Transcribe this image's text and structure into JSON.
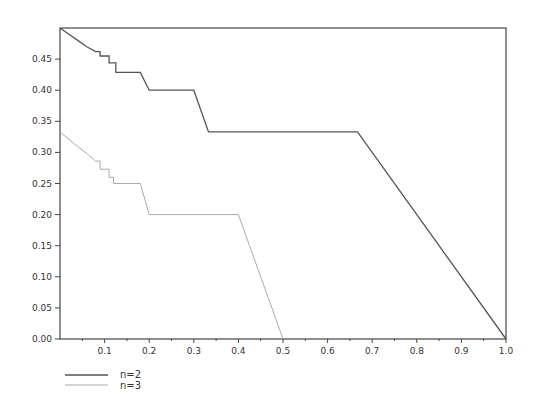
{
  "chart_data": {
    "type": "line",
    "title": "",
    "xlabel": "",
    "ylabel": "",
    "xlim": [
      0,
      1.0
    ],
    "ylim": [
      0,
      0.5
    ],
    "grid": false,
    "legend_position": "below-left",
    "x_ticks": [
      "0.1",
      "0.2",
      "0.3",
      "0.4",
      "0.5",
      "0.6",
      "0.7",
      "0.8",
      "0.9",
      "1.0"
    ],
    "y_ticks": [
      "0.00",
      "0.05",
      "0.10",
      "0.15",
      "0.20",
      "0.25",
      "0.30",
      "0.35",
      "0.40",
      "0.45"
    ],
    "series": [
      {
        "name": "n=2",
        "color": "#555555",
        "points": [
          [
            0.0,
            0.5
          ],
          [
            0.02,
            0.49
          ],
          [
            0.04,
            0.48
          ],
          [
            0.06,
            0.47
          ],
          [
            0.08,
            0.462
          ],
          [
            0.09,
            0.462
          ],
          [
            0.09,
            0.455
          ],
          [
            0.11,
            0.455
          ],
          [
            0.11,
            0.444
          ],
          [
            0.125,
            0.444
          ],
          [
            0.125,
            0.4286
          ],
          [
            0.18,
            0.4286
          ],
          [
            0.2,
            0.4
          ],
          [
            0.3,
            0.4
          ],
          [
            0.333,
            0.333
          ],
          [
            0.667,
            0.333
          ],
          [
            1.0,
            0.0
          ]
        ]
      },
      {
        "name": "n=3",
        "color": "#aaaaaa",
        "points": [
          [
            0.0,
            0.333
          ],
          [
            0.03,
            0.315
          ],
          [
            0.06,
            0.298
          ],
          [
            0.08,
            0.286
          ],
          [
            0.09,
            0.286
          ],
          [
            0.09,
            0.273
          ],
          [
            0.11,
            0.273
          ],
          [
            0.11,
            0.26
          ],
          [
            0.12,
            0.26
          ],
          [
            0.12,
            0.25
          ],
          [
            0.18,
            0.25
          ],
          [
            0.2,
            0.2
          ],
          [
            0.4,
            0.2
          ],
          [
            0.5,
            0.0
          ]
        ]
      }
    ]
  },
  "legend": {
    "items": [
      {
        "label": "n=2",
        "color": "#555555"
      },
      {
        "label": "n=3",
        "color": "#aaaaaa"
      }
    ]
  }
}
